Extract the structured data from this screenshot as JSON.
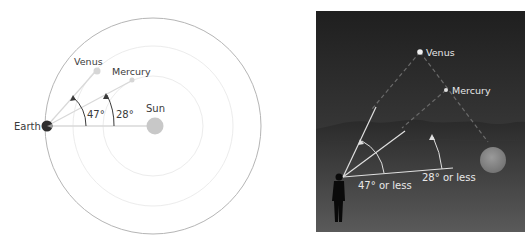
{
  "left_diagram": {
    "title": "Orbital view",
    "labels": {
      "earth": "Earth",
      "sun": "Sun",
      "venus": "Venus",
      "mercury": "Mercury",
      "venus_angle": "47°",
      "mercury_angle": "28°"
    },
    "colors": {
      "outer_orbit": "#b5b5b5",
      "inner_orbits": "#ececec",
      "sight_lines": "#d8d8d8",
      "sun": "#c8c8c8",
      "earth": "#2e2e2e",
      "planets": "#d6d6d6",
      "text": "#3a3a3a"
    }
  },
  "right_diagram": {
    "title": "Observer view",
    "labels": {
      "venus": "Venus",
      "mercury": "Mercury",
      "venus_angle": "47° or less",
      "mercury_angle": "28° or less"
    },
    "colors": {
      "sky_top": "#1f1f1f",
      "sky_bottom": "#4a4a4a",
      "hills": "#2c2c2c",
      "ground_top": "#3a3a3a",
      "ground_bottom": "#5a5a5a",
      "sun": "#8a8a8a",
      "lines": "#e0e0e0",
      "text": "#e8e8e8",
      "observer": "#0a0a0a"
    }
  }
}
